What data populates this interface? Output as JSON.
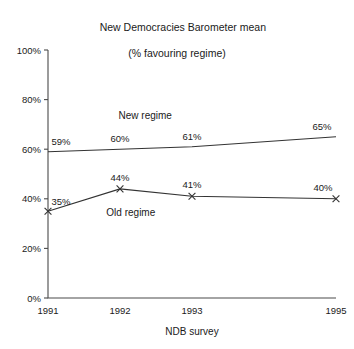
{
  "chart_data": {
    "type": "line",
    "title": "New Democracies Barometer mean",
    "subtitle": "(% favouring regime)",
    "xlabel": "NDB survey",
    "ylabel": "",
    "categories": [
      "1991",
      "1992",
      "1993",
      "1995"
    ],
    "x": [
      1991,
      1992,
      1993,
      1995
    ],
    "ylim": [
      0,
      100
    ],
    "xlim": [
      1991,
      1995
    ],
    "yticks": [
      0,
      20,
      40,
      60,
      80,
      100
    ],
    "ytick_labels": [
      "0%",
      "20%",
      "40%",
      "60%",
      "80%",
      "100%"
    ],
    "xtick_labels": [
      "1991",
      "1992",
      "1993",
      "1995"
    ],
    "grid": false,
    "legend_position": "inline-annotation",
    "series": [
      {
        "name": "New regime",
        "values": [
          59,
          60,
          61,
          65
        ],
        "point_labels": [
          "59%",
          "60%",
          "61%",
          "65%"
        ],
        "marker": "none",
        "color": "#333333"
      },
      {
        "name": "Old regime",
        "values": [
          35,
          44,
          41,
          40
        ],
        "point_labels": [
          "35%",
          "44%",
          "41%",
          "40%"
        ],
        "marker": "x",
        "color": "#333333"
      }
    ],
    "annotations": [
      {
        "text": "New regime",
        "x": 1992.35,
        "y": 72
      },
      {
        "text": "Old regime",
        "x": 1992.15,
        "y": 33
      }
    ]
  },
  "colors": {
    "background": "#ffffff",
    "axis": "#4a4a4a",
    "line": "#333333",
    "text": "#1a1a1a"
  }
}
